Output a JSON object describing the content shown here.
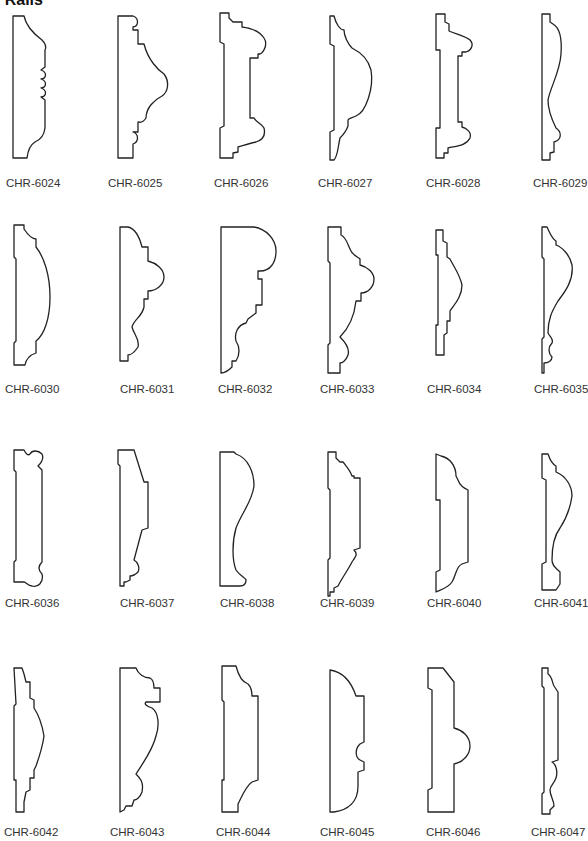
{
  "header": {
    "title": "r Rails"
  },
  "profiles": [
    {
      "code": "CHR-6024",
      "x": 0,
      "y": 0,
      "lx": 6,
      "ly": 177,
      "d": "M13 16 L24 16 C26 26 34 34 42 40 C46 44 46 48 45 50 L45 67 L41 70 C47 72 47 78 41 79 C47 81 47 87 41 88 C47 90 47 96 41 97 L45 100 L45 128 C44 136 40 140 35 142 C30 145 28 150 27 158 L13 158 Z"
    },
    {
      "code": "CHR-6025",
      "x": 98,
      "y": 0,
      "lx": 10,
      "ly": 177,
      "d": "M20 16 L35 16 C41 18 41 26 35 27 L35 30 L40 30 L40 44 L46 44 C50 60 60 70 66 74 C72 82 70 92 64 96 C56 100 48 108 48 118 C44 124 42 122 40 122 L40 132 L35 132 C41 134 41 142 35 144 L35 158 L20 158 Z"
    },
    {
      "code": "CHR-6026",
      "x": 196,
      "y": 0,
      "lx": 18,
      "ly": 177,
      "d": "M24 13 L33 13 L33 18 L37 22 L46 22 L46 27 C55 28 64 32 68 38 C72 44 68 52 64 54 L62 54 L62 58 L58 58 L54 58 L54 118 L58 118 C60 122 66 124 68 128 C70 136 66 140 60 142 C54 143 46 146 42 147 L42 152 L37 153 L37 158 L24 158 L24 128 L28 126 L28 44 L24 42 Z"
    },
    {
      "code": "CHR-6027",
      "x": 294,
      "y": 0,
      "lx": 24,
      "ly": 177,
      "d": "M36 16 L40 16 C42 24 46 30 50 30 C50 36 54 44 58 48 C66 52 74 58 77 70 C80 88 72 112 62 116 C58 118 55 118 54 120 L54 126 C52 132 48 136 46 138 C44 146 44 156 40 160 L36 160 L36 132 L40 130 L40 46 L36 44 Z"
    },
    {
      "code": "CHR-6028",
      "x": 392,
      "y": 0,
      "lx": 34,
      "ly": 177,
      "d": "M44 14 L53 14 L53 22 L57 24 L57 31 C64 34 74 36 78 40 C82 44 80 50 74 52 L70 52 L70 56 L66 56 L66 122 L70 122 L70 127 C74 128 80 132 78 138 C74 146 64 146 56 148 L56 153 L52 153 L52 158 L44 158 L44 128 L48 128 L48 50 L44 50 Z"
    },
    {
      "code": "CHR-6029",
      "x": 490,
      "y": 0,
      "lx": 43,
      "ly": 177,
      "d": "M52 14 L60 14 L60 22 L63 24 C70 28 72 40 71 54 C70 72 60 88 58 100 C58 108 62 120 66 128 C72 132 72 140 64 142 L64 152 L60 153 L60 160 L52 160 Z"
    }
  ],
  "rows": [
    {
      "y": 0,
      "labels_y": 177,
      "codes": [
        "CHR-6024",
        "CHR-6025",
        "CHR-6026",
        "CHR-6027",
        "CHR-6028",
        "CHR-6029"
      ]
    },
    {
      "y": 205,
      "labels_y": 383,
      "codes": [
        "CHR-6030",
        "CHR-6031",
        "CHR-6032",
        "CHR-6033",
        "CHR-6034",
        "CHR-6035"
      ]
    },
    {
      "y": 410,
      "labels_y": 596,
      "codes": [
        "CHR-6036",
        "CHR-6037",
        "CHR-6038",
        "CHR-6039",
        "CHR-6040",
        "CHR-6041"
      ]
    },
    {
      "y": 630,
      "labels_y": 826,
      "codes": [
        "CHR-6042",
        "CHR-6043",
        "CHR-6044",
        "CHR-6045",
        "CHR-6046",
        "CHR-6047"
      ]
    }
  ],
  "row2": [
    {
      "code": "CHR-6030",
      "x": 0,
      "lx": 5,
      "d": "M14 10 L24 10 L24 14 C28 20 32 24 36 24 L36 32 C44 42 50 60 50 82 C50 104 44 120 36 126 L36 138 C30 140 26 144 25 150 L14 150 L14 128 L16 126 L16 44 L14 42 Z"
    },
    {
      "code": "CHR-6031",
      "x": 98,
      "lx": 22,
      "d": "M22 12 L30 12 C38 14 42 24 44 32 L50 32 L50 46 C58 48 66 54 66 62 C66 70 58 76 50 76 L50 84 L46 84 L46 92 C44 102 36 104 34 112 C36 120 42 124 40 132 C36 138 32 140 30 140 L30 146 L22 146 Z"
    },
    {
      "code": "CHR-6032",
      "x": 196,
      "lx": 22,
      "d": "M25 12 L58 12 C70 14 80 24 80 36 C80 48 74 56 64 56 L62 56 L62 64 L66 64 L66 90 L60 90 L60 98 L52 104 L50 108 C42 110 38 118 40 126 C44 132 44 140 40 146 L36 146 L36 152 C32 156 28 158 25 158 Z"
    },
    {
      "code": "CHR-6033",
      "x": 294,
      "lx": 26,
      "d": "M34 12 L47 12 L47 20 C52 22 54 30 56 34 C58 40 64 42 66 44 L66 50 C74 52 80 58 80 64 C80 72 74 78 67 78 L67 86 L62 86 C60 104 54 114 46 122 C52 128 56 134 54 140 C52 146 48 148 46 148 L46 158 L34 158 L34 130 L36 128 L36 48 L34 46 Z"
    },
    {
      "code": "CHR-6034",
      "x": 392,
      "lx": 35,
      "d": "M44 15 L51 15 L51 26 L55 28 L55 42 L58 44 C62 52 68 60 70 70 C70 82 62 90 58 96 L58 106 L55 106 L55 118 L52 120 L52 140 L44 140 L44 110 L46 110 L46 40 L44 40 Z"
    },
    {
      "code": "CHR-6035",
      "x": 490,
      "lx": 44,
      "d": "M52 12 L57 12 C60 18 62 24 66 26 L66 30 C72 32 80 40 82 50 C84 66 74 78 68 86 C62 96 58 104 58 118 C60 122 64 124 62 128 C58 132 58 138 62 142 C62 146 58 148 54 148 L54 158 L52 158 L52 124 L54 122 L54 44 L52 42 Z"
    }
  ],
  "row3": [
    {
      "code": "CHR-6036",
      "x": 0,
      "lx": 5,
      "d": "M14 40 L24 40 C26 44 28 46 30 44 C32 40 38 40 42 44 C44 48 42 52 38 56 L42 60 L42 152 C38 156 38 160 42 164 C44 172 38 178 32 176 C28 176 26 172 24 172 L14 172 L14 152 L16 150 L16 62 L14 60 Z"
    },
    {
      "code": "CHR-6037",
      "x": 98,
      "lx": 22,
      "d": "M20 40 L36 40 L46 72 L50 72 L50 118 L44 120 L36 150 C40 152 42 158 40 162 C38 164 34 166 32 166 L32 170 L28 172 L26 172 L26 176 L22 176 L22 56 L20 54 Z"
    },
    {
      "code": "CHR-6038",
      "x": 196,
      "lx": 24,
      "d": "M24 42 L38 42 L40 44 C52 48 58 62 58 76 C56 92 46 102 40 118 C36 132 36 150 40 160 C44 166 50 168 50 170 C50 174 48 176 44 176 L24 176 Z"
    },
    {
      "code": "CHR-6039",
      "x": 294,
      "lx": 26,
      "d": "M34 42 L42 42 L42 48 L46 52 L49 52 C52 56 56 60 58 66 L60 66 L60 68 L66 68 L66 138 L60 140 C64 144 62 146 58 152 C54 160 48 168 44 176 L40 178 L40 182 L36 182 L36 186 L34 186 L34 150 L36 148 L36 80 L34 78 Z"
    },
    {
      "code": "CHR-6040",
      "x": 392,
      "lx": 35,
      "d": "M44 44 L49 46 C58 48 64 56 64 66 L66 70 C68 76 72 78 76 80 L76 152 L70 154 C64 156 64 166 60 172 C56 178 48 180 44 182 L44 162 L48 160 L48 90 L44 90 Z"
    },
    {
      "code": "CHR-6041",
      "x": 490,
      "lx": 44,
      "d": "M52 44 L58 44 C60 50 62 54 66 56 L66 62 C76 66 82 76 82 86 C80 100 74 112 70 118 C64 126 62 140 62 150 C62 156 66 158 70 162 L70 174 L66 180 L52 180 L52 154 L56 152 L56 70 L52 68 Z"
    }
  ],
  "row4": [
    {
      "code": "CHR-6042",
      "x": 0,
      "lx": 4,
      "d": "M14 38 L22 38 L24 44 L26 52 L30 52 L30 68 L34 70 L34 78 C38 84 42 94 44 106 C42 120 38 130 36 136 L34 140 L34 148 L30 148 L30 160 L26 162 L24 172 L24 182 L16 182 L16 150 L14 150 L14 76 L16 74 Z"
    },
    {
      "code": "CHR-6043",
      "x": 98,
      "lx": 12,
      "d": "M22 38 L38 38 C40 44 46 48 52 48 C56 50 56 56 56 58 L62 58 L62 72 L48 72 C46 74 48 76 54 78 C60 82 62 94 58 106 C54 122 44 134 38 144 C42 148 46 152 44 162 C42 168 38 170 36 170 L34 176 L28 176 L26 180 L22 182 Z"
    },
    {
      "code": "CHR-6044",
      "x": 196,
      "lx": 20,
      "d": "M26 36 L40 36 C42 44 46 52 52 54 C56 58 56 62 56 66 L62 66 L62 150 L56 152 C50 156 46 166 42 174 L42 182 L26 182 L26 150 L28 150 L28 72 L26 70 Z"
    },
    {
      "code": "CHR-6045",
      "x": 294,
      "lx": 26,
      "d": "M36 40 C50 42 58 54 62 66 L70 66 L70 112 L66 114 C60 120 62 128 66 130 L70 132 L70 140 L64 142 L64 156 C64 172 54 180 40 182 L36 182 Z"
    },
    {
      "code": "CHR-6046",
      "x": 392,
      "lx": 34,
      "d": "M36 38 L51 38 L62 52 L62 98 C70 100 78 106 78 116 C78 124 72 132 62 134 L62 182 L36 182 L36 160 L40 158 L40 60 L36 58 Z"
    },
    {
      "code": "CHR-6047",
      "x": 490,
      "lx": 41,
      "d": "M52 38 L58 38 L58 44 C62 46 62 52 64 56 L68 62 L68 130 L62 132 C66 134 68 142 66 148 C64 154 60 156 60 160 C60 166 64 170 64 176 L60 180 L60 184 L52 184 L52 164 L54 162 L54 58 L52 56 Z"
    }
  ]
}
